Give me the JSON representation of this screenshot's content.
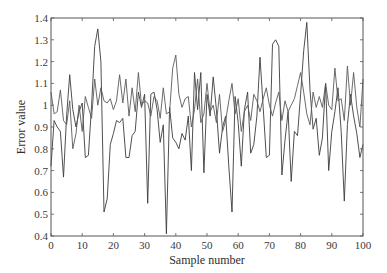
{
  "chart_data": {
    "type": "line",
    "title": "",
    "xlabel": "Sample number",
    "ylabel": "Error value",
    "xlim": [
      0,
      100
    ],
    "ylim": [
      0.4,
      1.4
    ],
    "xticks": [
      0,
      10,
      20,
      30,
      40,
      50,
      60,
      70,
      80,
      90,
      100
    ],
    "yticks": [
      0.4,
      0.5,
      0.6,
      0.7,
      0.8,
      0.9,
      1,
      1.1,
      1.2,
      1.3,
      1.4
    ],
    "grid": false,
    "legend": null,
    "x": [
      0,
      1,
      2,
      3,
      4,
      5,
      6,
      7,
      8,
      9,
      10,
      11,
      12,
      13,
      14,
      15,
      16,
      17,
      18,
      19,
      20,
      21,
      22,
      23,
      24,
      25,
      26,
      27,
      28,
      29,
      30,
      31,
      32,
      33,
      34,
      35,
      36,
      37,
      38,
      39,
      40,
      41,
      42,
      43,
      44,
      45,
      46,
      47,
      48,
      49,
      50,
      51,
      52,
      53,
      54,
      55,
      56,
      57,
      58,
      59,
      60,
      61,
      62,
      63,
      64,
      65,
      66,
      67,
      68,
      69,
      70,
      71,
      72,
      73,
      74,
      75,
      76,
      77,
      78,
      79,
      80,
      81,
      82,
      83,
      84,
      85,
      86,
      87,
      88,
      89,
      90,
      91,
      92,
      93,
      94,
      95,
      96,
      97,
      98,
      99,
      100
    ],
    "series": [
      {
        "name": "Series 1",
        "color": "#3c3c3c",
        "values": [
          0.72,
          0.93,
          0.9,
          0.88,
          0.67,
          0.95,
          1.14,
          0.98,
          0.9,
          0.97,
          1.01,
          0.76,
          0.77,
          1.0,
          1.27,
          1.35,
          1.2,
          0.51,
          0.57,
          0.82,
          0.87,
          0.93,
          0.92,
          0.94,
          0.76,
          0.76,
          0.86,
          0.88,
          1.06,
          0.99,
          1.05,
          0.55,
          1.05,
          1.06,
          0.98,
          0.83,
          0.91,
          0.41,
          0.99,
          0.85,
          0.83,
          0.8,
          0.87,
          0.84,
          0.95,
          0.7,
          1.15,
          0.98,
          1.15,
          0.69,
          1.05,
          0.95,
          1.13,
          0.98,
          0.78,
          0.9,
          0.95,
          0.72,
          0.51,
          1.04,
          0.92,
          0.72,
          0.98,
          1.06,
          0.78,
          0.82,
          0.95,
          1.22,
          0.99,
          0.76,
          0.77,
          1.28,
          1.3,
          1.27,
          0.68,
          0.84,
          0.97,
          0.65,
          0.88,
          0.86,
          1.05,
          1.25,
          1.38,
          1.07,
          0.89,
          0.94,
          0.77,
          0.85,
          1.1,
          0.7,
          0.88,
          0.97,
          1.08,
          0.88,
          0.56,
          0.91,
          1.05,
          0.95,
          0.87,
          0.76,
          0.82
        ]
      },
      {
        "name": "Series 2",
        "color": "#5a5a5a",
        "values": [
          1.06,
          0.96,
          0.97,
          1.07,
          0.93,
          0.91,
          1.02,
          0.8,
          0.87,
          1.0,
          0.88,
          1.04,
          0.99,
          0.94,
          1.12,
          1.0,
          1.08,
          1.02,
          1.01,
          1.03,
          0.98,
          1.02,
          1.14,
          1.01,
          1.12,
          0.95,
          1.08,
          0.97,
          1.15,
          1.0,
          1.02,
          1.01,
          0.95,
          1.04,
          1.02,
          0.94,
          1.08,
          0.96,
          0.97,
          1.17,
          1.23,
          1.05,
          0.99,
          1.03,
          1.04,
          0.9,
          0.98,
          1.12,
          0.92,
          0.96,
          1.1,
          0.97,
          1.0,
          0.92,
          1.05,
          0.88,
          0.93,
          1.02,
          1.1,
          0.96,
          1.03,
          0.88,
          0.97,
          1.0,
          0.93,
          1.05,
          1.02,
          0.97,
          1.03,
          1.08,
          1.0,
          0.95,
          1.01,
          1.06,
          0.93,
          1.02,
          0.97,
          1.0,
          1.03,
          1.09,
          1.15,
          1.06,
          0.96,
          0.91,
          1.06,
          0.99,
          1.04,
          0.99,
          1.1,
          1.0,
          0.98,
          1.17,
          1.02,
          1.03,
          0.93,
          1.18,
          1.0,
          1.15,
          0.99,
          0.9,
          1.12
        ]
      }
    ]
  },
  "plot_area": {
    "left": 51,
    "top": 18,
    "right": 363,
    "bottom": 236
  }
}
